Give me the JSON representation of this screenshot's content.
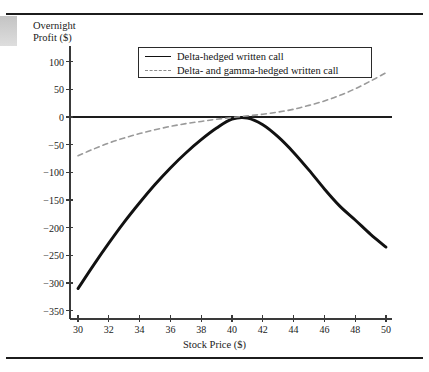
{
  "figure": {
    "top_rule": "horizontal-rule",
    "bottom_rule": "horizontal-rule"
  },
  "chart_data": {
    "type": "line",
    "title": "",
    "xlabel": "Stock Price ($)",
    "ylabel": "Overnight\nProfit ($)",
    "ylabel_line1": "Overnight",
    "ylabel_line2": "Profit ($)",
    "xlim": [
      29,
      51
    ],
    "ylim": [
      -360,
      125
    ],
    "xticks": [
      30,
      32,
      34,
      36,
      38,
      40,
      42,
      44,
      46,
      48,
      50
    ],
    "xtick_labels": [
      "30",
      "32",
      "34",
      "36",
      "38",
      "40",
      "42",
      "44",
      "46",
      "48",
      "50"
    ],
    "yticks": [
      100,
      50,
      0,
      -50,
      -100,
      -150,
      -200,
      -250,
      -300,
      -350
    ],
    "ytick_labels": [
      "100",
      "50",
      "0",
      "−50",
      "−100",
      "−150",
      "−200",
      "−250",
      "−300",
      "−350"
    ],
    "grid": false,
    "zero_line": 0,
    "legend_position": "upper center",
    "series": [
      {
        "name": "Delta-hedged written call",
        "style": "solid",
        "color": "#111111",
        "x": [
          30,
          31,
          32,
          33,
          34,
          35,
          36,
          37,
          38,
          39,
          40,
          41,
          42,
          43,
          44,
          45,
          46,
          47,
          48,
          49,
          50
        ],
        "values": [
          -310,
          -268,
          -228,
          -190,
          -155,
          -122,
          -92,
          -65,
          -41,
          -20,
          -4,
          -2,
          -14,
          -36,
          -64,
          -96,
          -130,
          -161,
          -186,
          -212,
          -235
        ]
      },
      {
        "name": "Delta- and gamma-hedged written call",
        "style": "dashed",
        "color": "#9a9a9a",
        "x": [
          30,
          31,
          32,
          33,
          34,
          35,
          36,
          37,
          38,
          39,
          40,
          41,
          42,
          43,
          44,
          45,
          46,
          47,
          48,
          49,
          50
        ],
        "values": [
          -70,
          -58,
          -47,
          -38,
          -30,
          -23,
          -17,
          -12,
          -8,
          -4,
          -1,
          2,
          5,
          9,
          14,
          21,
          29,
          39,
          51,
          65,
          80
        ]
      }
    ]
  },
  "legend": {
    "entries": [
      {
        "label": "Delta-hedged written call",
        "style": "solid"
      },
      {
        "label": "Delta- and gamma-hedged written call",
        "style": "dashed"
      }
    ]
  }
}
